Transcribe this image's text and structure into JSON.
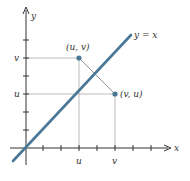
{
  "figure": {
    "axes": {
      "x_label": "x",
      "y_label": "y",
      "x_tick_labels": [
        {
          "label": "u",
          "index": 3
        },
        {
          "label": "v",
          "index": 5
        }
      ],
      "y_tick_labels": [
        {
          "label": "u",
          "index": 3
        },
        {
          "label": "v",
          "index": 5
        }
      ],
      "x_tick_count": 7,
      "y_tick_count": 6
    },
    "line": {
      "label": "y = x",
      "color": "#4a7896"
    },
    "points": [
      {
        "label": "(u, v)",
        "coords": "(u, v)",
        "color": "#4a7896"
      },
      {
        "label": "(v, u)",
        "coords": "(v, u)",
        "color": "#4a7896"
      }
    ],
    "colors": {
      "axis": "#333333",
      "guide": "#aaaaaa",
      "text": "#333333"
    }
  }
}
